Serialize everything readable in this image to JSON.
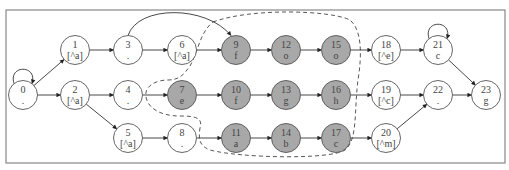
{
  "diagram": {
    "type": "state-machine",
    "frame": {
      "x": 6,
      "y": 10,
      "w": 499,
      "h": 153
    },
    "colors": {
      "shaded_fill": "#a8a8a8",
      "plain_fill": "#ffffff",
      "stroke": "#555555",
      "frame": "#888888"
    },
    "node_radius": 14.5,
    "nodes": [
      {
        "id": "0",
        "label": ".",
        "x": 23,
        "y": 95,
        "shaded": false
      },
      {
        "id": "1",
        "label": "[^a]",
        "x": 75,
        "y": 50,
        "shaded": false
      },
      {
        "id": "2",
        "label": "[^a]",
        "x": 75,
        "y": 95,
        "shaded": false
      },
      {
        "id": "3",
        "label": ".",
        "x": 128,
        "y": 50,
        "shaded": false
      },
      {
        "id": "4",
        "label": ".",
        "x": 128,
        "y": 95,
        "shaded": false
      },
      {
        "id": "5",
        "label": "[^a]",
        "x": 128,
        "y": 138,
        "shaded": false
      },
      {
        "id": "6",
        "label": "[^a]",
        "x": 182,
        "y": 50,
        "shaded": false
      },
      {
        "id": "7",
        "label": "e",
        "x": 182,
        "y": 95,
        "shaded": true
      },
      {
        "id": "8",
        "label": ".",
        "x": 182,
        "y": 138,
        "shaded": false
      },
      {
        "id": "9",
        "label": "f",
        "x": 236,
        "y": 50,
        "shaded": true
      },
      {
        "id": "10",
        "label": "f",
        "x": 236,
        "y": 95,
        "shaded": true
      },
      {
        "id": "11",
        "label": "a",
        "x": 236,
        "y": 138,
        "shaded": true
      },
      {
        "id": "12",
        "label": "o",
        "x": 286,
        "y": 50,
        "shaded": true
      },
      {
        "id": "13",
        "label": "g",
        "x": 286,
        "y": 95,
        "shaded": true
      },
      {
        "id": "14",
        "label": "b",
        "x": 286,
        "y": 138,
        "shaded": true
      },
      {
        "id": "15",
        "label": "o",
        "x": 336,
        "y": 50,
        "shaded": true
      },
      {
        "id": "16",
        "label": "h",
        "x": 336,
        "y": 95,
        "shaded": true
      },
      {
        "id": "17",
        "label": "c",
        "x": 336,
        "y": 138,
        "shaded": true
      },
      {
        "id": "18",
        "label": "[^e]",
        "x": 386,
        "y": 50,
        "shaded": false
      },
      {
        "id": "19",
        "label": "[^c]",
        "x": 386,
        "y": 95,
        "shaded": false
      },
      {
        "id": "20",
        "label": "[^m]",
        "x": 386,
        "y": 138,
        "shaded": false
      },
      {
        "id": "21",
        "label": "c",
        "x": 438,
        "y": 50,
        "shaded": false
      },
      {
        "id": "22",
        "label": ".",
        "x": 438,
        "y": 95,
        "shaded": false
      },
      {
        "id": "23",
        "label": "g",
        "x": 486,
        "y": 95,
        "shaded": false
      }
    ],
    "edges": [
      {
        "from": "0",
        "to": "0",
        "self_loop": true
      },
      {
        "from": "0",
        "to": "1"
      },
      {
        "from": "0",
        "to": "2"
      },
      {
        "from": "1",
        "to": "3"
      },
      {
        "from": "2",
        "to": "4"
      },
      {
        "from": "2",
        "to": "5"
      },
      {
        "from": "3",
        "to": "6"
      },
      {
        "from": "3",
        "to": "9",
        "curved": true
      },
      {
        "from": "4",
        "to": "7"
      },
      {
        "from": "5",
        "to": "8"
      },
      {
        "from": "6",
        "to": "9"
      },
      {
        "from": "7",
        "to": "10"
      },
      {
        "from": "8",
        "to": "11"
      },
      {
        "from": "9",
        "to": "12"
      },
      {
        "from": "10",
        "to": "13"
      },
      {
        "from": "11",
        "to": "14"
      },
      {
        "from": "12",
        "to": "15"
      },
      {
        "from": "13",
        "to": "16"
      },
      {
        "from": "14",
        "to": "17"
      },
      {
        "from": "15",
        "to": "18"
      },
      {
        "from": "16",
        "to": "19"
      },
      {
        "from": "17",
        "to": "20"
      },
      {
        "from": "18",
        "to": "21"
      },
      {
        "from": "21",
        "to": "21",
        "self_loop": true
      },
      {
        "from": "19",
        "to": "22"
      },
      {
        "from": "20",
        "to": "22"
      },
      {
        "from": "21",
        "to": "23"
      },
      {
        "from": "22",
        "to": "23"
      }
    ],
    "highlight_region": {
      "style": "dashed",
      "contains": [
        "7",
        "9",
        "10",
        "11",
        "12",
        "13",
        "14",
        "15",
        "16",
        "17"
      ]
    }
  }
}
